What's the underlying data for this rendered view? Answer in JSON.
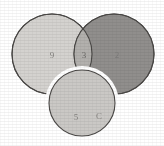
{
  "diagram": {
    "type": "venn",
    "background_color": "#ffffff",
    "outline_color": "#4a4846",
    "regions": [
      {
        "id": "left",
        "name": "left-circle",
        "label": "9",
        "fill_color": "#d4d2cf",
        "cx": 52,
        "cy": 54,
        "r": 40
      },
      {
        "id": "right",
        "name": "right-circle",
        "label": "2",
        "fill_color": "#8c8a88",
        "cx": 114,
        "cy": 54,
        "r": 40
      },
      {
        "id": "intersection",
        "name": "intersection-lens",
        "label": "3",
        "fill_color": "#b0aeab",
        "cx": 83,
        "cy": 54
      },
      {
        "id": "bottom",
        "name": "bottom-circle",
        "label": "5",
        "label_secondary": "C",
        "fill_color": "#cac8c5",
        "cx": 82,
        "cy": 103,
        "r": 33
      }
    ]
  },
  "labels": {
    "left_value": "9",
    "intersection_value": "3",
    "right_value": "2",
    "bottom_value": "5",
    "bottom_letter": "C"
  }
}
